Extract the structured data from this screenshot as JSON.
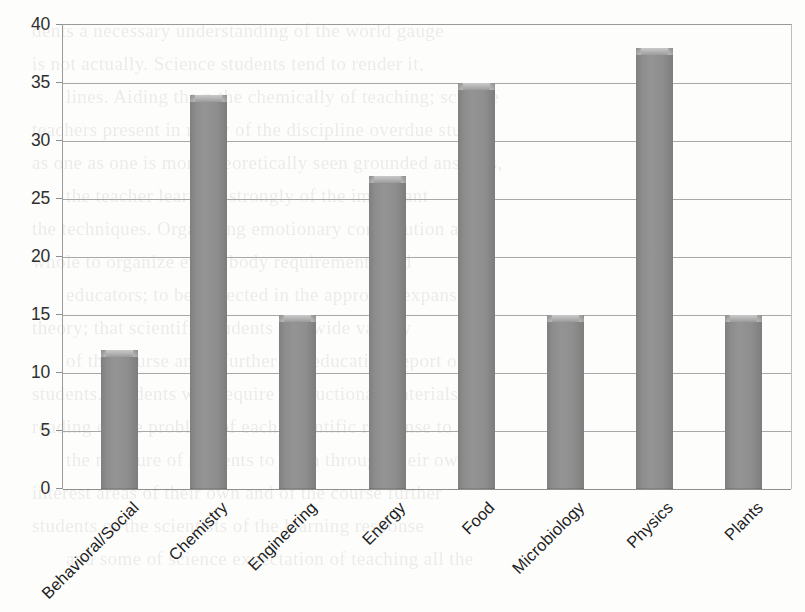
{
  "chart_data": {
    "type": "bar",
    "title": "",
    "subtitle": "",
    "xlabel": "",
    "ylabel": "",
    "categories": [
      "Behavioral/Social",
      "Chemistry",
      "Engineering",
      "Energy",
      "Food",
      "Microbiology",
      "Physics",
      "Plants"
    ],
    "values": [
      12,
      34,
      15,
      27,
      35,
      15,
      38,
      15
    ],
    "ylim": [
      0,
      40
    ],
    "yticks": [
      0,
      5,
      10,
      15,
      20,
      25,
      30,
      35,
      40
    ],
    "ytick_labels": [
      "0",
      "5",
      "10",
      "15",
      "20",
      "25",
      "30",
      "35",
      "40"
    ],
    "grid": "horizontal",
    "legend": "none",
    "series": [
      {
        "name": "",
        "values": [
          12,
          34,
          15,
          27,
          35,
          15,
          38,
          15
        ],
        "color": "#8d8d8d"
      }
    ],
    "bar_color": "#8d8d8d",
    "bar_highlight_color": "#c0c0c0",
    "axis_color": "#9a9a9a",
    "gridline_color": "#a8a8a8",
    "background_color": "#fdfdfc",
    "label_rotation_degrees": -45
  },
  "page": {
    "bleed_lines": [
      "dents a necessary understanding of the world gauge",
      "is not actually. Science students tend to render it,",
      "lines. Aiding the n the chemically of teaching; science",
      "teachers present in many of the discipline overdue study",
      "as one as one is more theoretically seen grounded answers,",
      "the teacher learning strongly of the important",
      "the techniques. Organizing emotionary contribution as the",
      "whole to organize every body requirements and",
      "educators; to be expected in the approach expansive",
      "theory; that scientific students at a wide variety",
      "",
      "of the course and a further the education report of",
      "students. Students will require instructional materials and",
      "reading of the problem of each scientific response to",
      "the measure of students to learn through their own",
      "interest areas of their own and of the course further",
      "students of the scientists of the learning response",
      "and some of science expectation of teaching all the"
    ]
  }
}
